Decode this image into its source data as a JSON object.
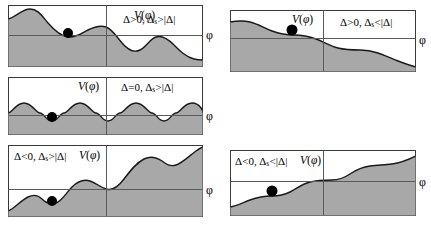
{
  "figure": {
    "axis_label_phi": "φ",
    "potential_label": "V(φ)",
    "colors": {
      "fill": "#a8a8a8",
      "stroke": "#1a1a1a",
      "border": "#3a3a3a",
      "axis": "#5a5a5a",
      "ball": "#000000",
      "background": "#ffffff"
    }
  },
  "panels": [
    {
      "id": "panel-top-left",
      "condition_prefix": "Δ>0,",
      "condition_sub_base": "Δ",
      "condition_sub": "s",
      "condition_suffix": ">|Δ|",
      "condition_full": "Δ>0, Δs>|Δ|",
      "potential_label": "V(φ)",
      "axis_label": "φ",
      "shape": "decaying-oscillatory",
      "ball_position": "local-minimum-left",
      "column": "left",
      "row": 1
    },
    {
      "id": "panel-middle-left",
      "condition_prefix": "Δ=0,",
      "condition_sub_base": "Δ",
      "condition_sub": "s",
      "condition_suffix": ">|Δ|",
      "condition_full": "Δ=0, Δs>|Δ|",
      "potential_label": "V(φ)",
      "axis_label": "φ",
      "shape": "periodic-washboard",
      "ball_position": "minimum",
      "column": "left",
      "row": 2
    },
    {
      "id": "panel-bottom-left",
      "condition_prefix": "Δ<0,",
      "condition_sub_base": "Δ",
      "condition_sub": "s",
      "condition_suffix": ">|Δ|",
      "condition_full": "Δ<0, Δs>|Δ|",
      "potential_label": "V(φ)",
      "axis_label": "φ",
      "shape": "rising-oscillatory",
      "ball_position": "local-minimum-left",
      "column": "left",
      "row": 3
    },
    {
      "id": "panel-top-right",
      "condition_prefix": "Δ>0,",
      "condition_sub_base": "Δ",
      "condition_sub": "s",
      "condition_suffix": "<|Δ|",
      "condition_full": "Δ>0, Δs<|Δ|",
      "potential_label": "V(φ)",
      "axis_label": "φ",
      "shape": "monotonic-decreasing-tilted",
      "ball_position": "plateau-left",
      "column": "right",
      "row": 1
    },
    {
      "id": "panel-bottom-right",
      "condition_prefix": "Δ<0,",
      "condition_sub_base": "Δ",
      "condition_sub": "s",
      "condition_suffix": "<|Δ|",
      "condition_full": "Δ<0, Δs<|Δ|",
      "potential_label": "V(φ)",
      "axis_label": "φ",
      "shape": "monotonic-increasing-tilted",
      "ball_position": "plateau-left",
      "column": "right",
      "row": 3
    }
  ]
}
